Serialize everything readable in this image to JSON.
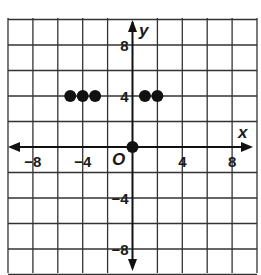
{
  "chart_data": {
    "type": "scatter",
    "title": "",
    "xlabel": "x",
    "ylabel": "y",
    "origin_label": "O",
    "xlim": [
      -10,
      10
    ],
    "ylim": [
      -10,
      10
    ],
    "grid": true,
    "grid_step": 2,
    "x_ticks": [
      {
        "value": -8,
        "label": "−8"
      },
      {
        "value": -4,
        "label": "−4"
      },
      {
        "value": 4,
        "label": "4"
      },
      {
        "value": 8,
        "label": "8"
      }
    ],
    "y_ticks": [
      {
        "value": 8,
        "label": "8"
      },
      {
        "value": 4,
        "label": "4"
      },
      {
        "value": -4,
        "label": "−4"
      },
      {
        "value": -8,
        "label": "−8"
      }
    ],
    "points": [
      {
        "x": -5,
        "y": 4
      },
      {
        "x": -4,
        "y": 4
      },
      {
        "x": -3,
        "y": 4
      },
      {
        "x": 1,
        "y": 4
      },
      {
        "x": 2,
        "y": 4
      },
      {
        "x": 0,
        "y": 0
      }
    ],
    "colors": {
      "grid": "#333333",
      "axis": "#111111",
      "points": "#111111"
    }
  }
}
